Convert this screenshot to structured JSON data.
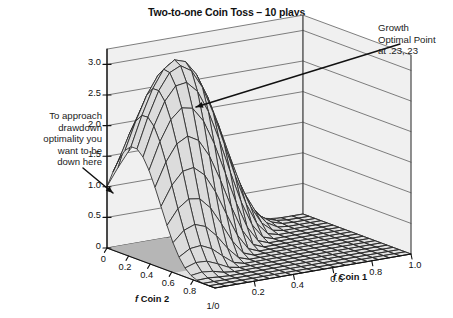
{
  "title": "Two-to-one Coin Toss – 10 plays",
  "annotations": {
    "left": {
      "name": "drawdown-note",
      "lines": [
        "To approach",
        "drawdown",
        "optimality you",
        "want to be",
        "down here"
      ]
    },
    "right": {
      "name": "growth-optimal-note",
      "lines": [
        "Growth",
        "Optimal Point",
        "at .23,.23"
      ]
    }
  },
  "axes": {
    "z": {
      "label": "",
      "ticks": [
        "3.0",
        "2.5",
        "2.0",
        "1.5",
        "1.0",
        "0.5",
        "0"
      ],
      "values": [
        3.0,
        2.5,
        2.0,
        1.5,
        1.0,
        0.5,
        0
      ],
      "range": [
        0,
        3.25
      ]
    },
    "x": {
      "label_prefix": "f",
      "label": " Coin 2",
      "ticks": [
        "0",
        "0.2",
        "0.4",
        "0.6",
        "0.8"
      ],
      "values": [
        0,
        0.2,
        0.4,
        0.6,
        0.8
      ],
      "range": [
        0,
        1
      ]
    },
    "y": {
      "label_prefix": "f",
      "label": " Coin 1",
      "ticks": [
        "0.2",
        "0.4",
        "0.6",
        "0.8",
        "1.0"
      ],
      "values": [
        0.2,
        0.4,
        0.6,
        0.8,
        1.0
      ],
      "range": [
        0,
        1
      ]
    },
    "origin_corner_label": "1/0"
  },
  "colors": {
    "wall": "#f0f0f0",
    "wall_line": "#4a4a4a",
    "floor_light": "#e2e2e2",
    "floor_shadow": "#b6b6b6",
    "mesh": "#2b2b2b",
    "surface_fill": "#dcdcdc",
    "text": "#1a1a1a",
    "leader": "#111111"
  },
  "chart_data": {
    "type": "surface",
    "title": "Two-to-one Coin Toss – 10 plays",
    "xlabel": "f Coin 2",
    "ylabel": "f Coin 1",
    "zlabel": "Geometric growth (TWR)",
    "xlim": [
      0,
      1
    ],
    "ylim": [
      0,
      1
    ],
    "zlim": [
      0,
      3.25
    ],
    "grid": true,
    "legend": "none",
    "optimal_point": {
      "x": 0.23,
      "y": 0.23,
      "z": 3.1,
      "label": "Growth Optimal Point at .23,.23"
    },
    "surface_note": "Z = TWR(fx,fy) for 10 plays of a 2:1 payoff coin toss wagered on two coins.",
    "samples": {
      "x": [
        0,
        0.1,
        0.2,
        0.3,
        0.4,
        0.5,
        0.6,
        0.7,
        0.8,
        0.9,
        1.0
      ],
      "y": [
        0,
        0.1,
        0.2,
        0.3,
        0.4,
        0.5,
        0.6,
        0.7,
        0.8,
        0.9,
        1.0
      ],
      "z": [
        [
          1.0,
          1.53,
          1.95,
          2.18,
          2.18,
          1.96,
          1.58,
          1.12,
          0.69,
          0.34,
          0.0
        ],
        [
          1.53,
          2.34,
          2.8,
          2.95,
          2.77,
          2.35,
          1.8,
          1.22,
          0.72,
          0.34,
          0.0
        ],
        [
          1.95,
          2.8,
          3.1,
          3.02,
          2.66,
          2.13,
          1.55,
          1.01,
          0.57,
          0.26,
          0.0
        ],
        [
          2.18,
          2.95,
          3.02,
          2.74,
          2.24,
          1.68,
          1.15,
          0.71,
          0.38,
          0.17,
          0.0
        ],
        [
          2.18,
          2.77,
          2.66,
          2.24,
          1.72,
          1.2,
          0.77,
          0.45,
          0.23,
          0.09,
          0.0
        ],
        [
          1.96,
          2.35,
          2.13,
          1.68,
          1.2,
          0.78,
          0.47,
          0.25,
          0.12,
          0.04,
          0.0
        ],
        [
          1.58,
          1.8,
          1.55,
          1.15,
          0.77,
          0.47,
          0.26,
          0.13,
          0.05,
          0.02,
          0.0
        ],
        [
          1.12,
          1.22,
          1.01,
          0.71,
          0.45,
          0.25,
          0.13,
          0.06,
          0.02,
          0.01,
          0.0
        ],
        [
          0.69,
          0.72,
          0.57,
          0.38,
          0.23,
          0.12,
          0.05,
          0.02,
          0.01,
          0.0,
          0.0
        ],
        [
          0.34,
          0.34,
          0.26,
          0.17,
          0.09,
          0.04,
          0.02,
          0.01,
          0.0,
          0.0,
          0.0
        ],
        [
          0.0,
          0.0,
          0.0,
          0.0,
          0.0,
          0.0,
          0.0,
          0.0,
          0.0,
          0.0,
          0.0
        ]
      ]
    }
  }
}
